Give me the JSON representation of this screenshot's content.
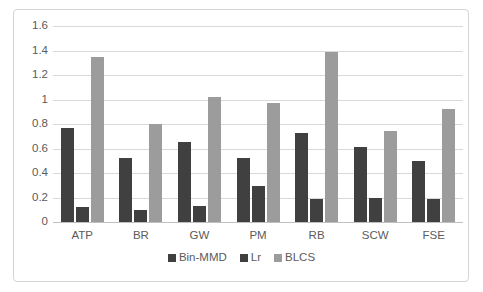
{
  "chart_data": {
    "type": "bar",
    "title": "",
    "subtitle": "",
    "xlabel": "",
    "ylabel": "",
    "categories": [
      "ATP",
      "BR",
      "GW",
      "PM",
      "RB",
      "SCW",
      "FSE"
    ],
    "series": [
      {
        "name": "Bin-MMD",
        "color": "#404040",
        "values": [
          0.77,
          0.52,
          0.65,
          0.52,
          0.73,
          0.61,
          0.5
        ]
      },
      {
        "name": "Lr",
        "color": "#404040",
        "values": [
          0.12,
          0.1,
          0.13,
          0.29,
          0.19,
          0.2,
          0.19
        ]
      },
      {
        "name": "BLCS",
        "color": "#9c9c9c",
        "values": [
          1.35,
          0.8,
          1.02,
          0.97,
          1.39,
          0.74,
          0.92
        ]
      }
    ],
    "ylim": [
      0,
      1.6
    ],
    "ytick_values": [
      0,
      0.2,
      0.4,
      0.6,
      0.8,
      1,
      1.2,
      1.4,
      1.6
    ],
    "ytick_labels": [
      "0",
      "0.2",
      "0.4",
      "0.6",
      "0.8",
      "1",
      "1.2",
      "1.4",
      "1.6"
    ],
    "grid": true,
    "grid_color": "#d9d9d9",
    "legend_position": "bottom",
    "legend_entries": [
      "Bin-MMD",
      "Lr",
      "BLCS"
    ],
    "background_color": "#ffffff",
    "border_color": "#d4d4d4",
    "text_color": "#5b5b5b"
  }
}
